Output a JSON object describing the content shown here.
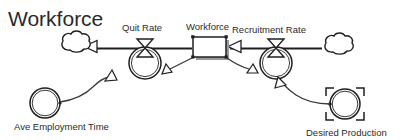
{
  "diagram": {
    "title": "Workforce",
    "type": "stock-and-flow",
    "nodes": {
      "stock": {
        "label": "Workforce",
        "kind": "stock-box",
        "selected": true
      },
      "quit_rate": {
        "label": "Quit Rate",
        "kind": "flow-valve"
      },
      "recruitment_rate": {
        "label": "Recruitment Rate",
        "kind": "flow-valve"
      },
      "ave_employment_time": {
        "label": "Ave Employment Time",
        "kind": "variable-circle"
      },
      "desired_production": {
        "label": "Desired Production",
        "kind": "variable-circle",
        "selected": true
      },
      "sink_cloud": {
        "label": "",
        "kind": "cloud-sink"
      },
      "source_cloud": {
        "label": "",
        "kind": "cloud-source"
      }
    },
    "colors": {
      "stroke": "#1f1f1f",
      "connector": "#3a3a3a",
      "fill": "#ffffff",
      "shadow": "#9a9a9a",
      "text": "#2b2b2b",
      "background": "#ffffff"
    }
  }
}
